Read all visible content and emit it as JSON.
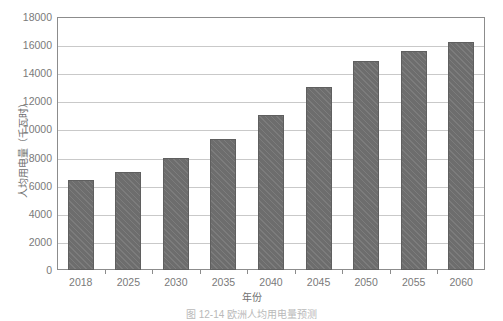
{
  "chart_data": {
    "type": "bar",
    "title": "",
    "xlabel": "年份",
    "ylabel": "人均用电量（千瓦时）",
    "categories": [
      "2018",
      "2025",
      "2030",
      "2035",
      "2040",
      "2045",
      "2050",
      "2055",
      "2060"
    ],
    "values": [
      6400,
      7000,
      8000,
      9300,
      11000,
      13000,
      14900,
      15600,
      16200
    ],
    "series": [
      {
        "name": "人均用电量",
        "values": [
          6400,
          7000,
          8000,
          9300,
          11000,
          13000,
          14900,
          15600,
          16200
        ]
      }
    ],
    "ylim": [
      0,
      18000
    ],
    "ytick_values": [
      0,
      2000,
      4000,
      6000,
      8000,
      10000,
      12000,
      14000,
      16000,
      18000
    ],
    "ytick_labels": [
      "0",
      "2000",
      "4000",
      "6000",
      "8000",
      "10000",
      "12000",
      "14000",
      "16000",
      "18000"
    ],
    "grid": true,
    "legend": "none",
    "bar_color": "#6d6d6d",
    "bar_edge_color": "#5f5f5f",
    "grid_color": "#c9c9c9",
    "axis_color": "#8c8c8c",
    "text_color": "#7a7a7a"
  },
  "caption": {
    "text": "图 12-14  欧洲人均用电量预测"
  }
}
